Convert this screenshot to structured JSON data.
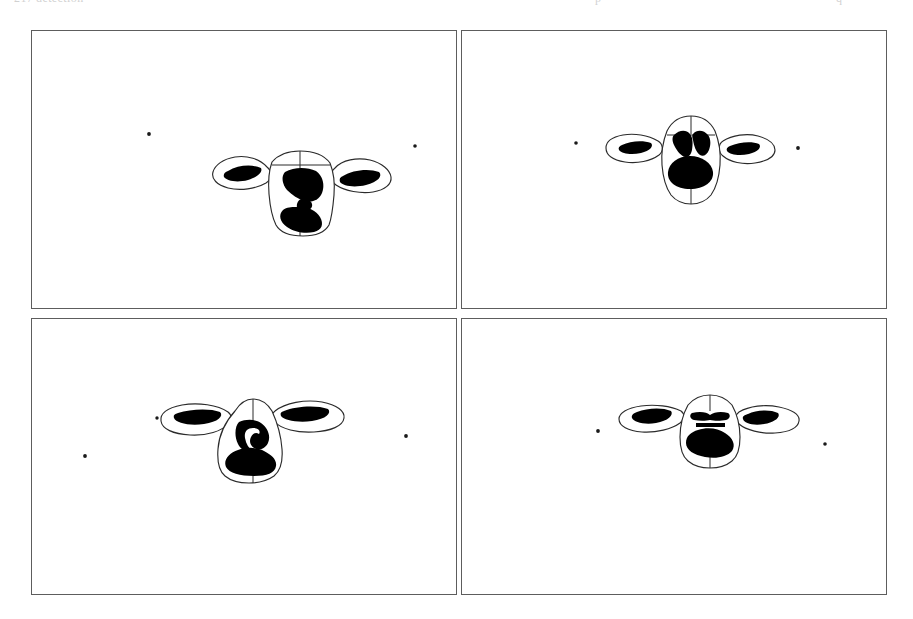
{
  "page": {
    "background_color": "#ffffff",
    "width": 913,
    "height": 619,
    "clipped_header_text": "ions of the head region detected across frames",
    "clipped_header_fragments": [
      {
        "text": "217",
        "left": 14
      },
      {
        "text": "detection",
        "left": 36
      },
      {
        "text": "p",
        "left": 595
      },
      {
        "text": "q",
        "left": 836
      }
    ]
  },
  "figure": {
    "caption": "",
    "panel_count": 4,
    "layout": "2x2 grid",
    "border_color": "#5d5d5d",
    "outline_color": "#2b2b2b",
    "patch_color": "#000000",
    "panels": [
      {
        "id": "panel-a",
        "label": "",
        "position": "top-left",
        "subject": "cow-head-outline",
        "head": {
          "center_x": 285,
          "center_y": 165,
          "width": 132,
          "height": 82,
          "ear_tilt": "slight-down",
          "patches": [
            "forehead-blaze",
            "muzzle-patch",
            "left-ear-patch",
            "right-ear-patch"
          ]
        },
        "specks": [
          {
            "x": 117,
            "y": 103,
            "r": 1.9
          },
          {
            "x": 383,
            "y": 115,
            "r": 1.8
          }
        ]
      },
      {
        "id": "panel-b",
        "label": "",
        "position": "top-right",
        "subject": "cow-head-outline",
        "head": {
          "center_x": 230,
          "center_y": 112,
          "width": 125,
          "height": 78,
          "ear_tilt": "level",
          "patches": [
            "forehead-band",
            "muzzle-oval",
            "left-ear-patch",
            "right-ear-patch"
          ]
        },
        "specks": [
          {
            "x": 114,
            "y": 112,
            "r": 1.8
          },
          {
            "x": 336,
            "y": 117,
            "r": 1.9
          }
        ]
      },
      {
        "id": "panel-c",
        "label": "",
        "position": "bottom-left",
        "subject": "cow-head-outline",
        "head": {
          "center_x": 218,
          "center_y": 117,
          "width": 168,
          "height": 72,
          "ear_tilt": "raised-long",
          "patches": [
            "forehead-blaze",
            "muzzle-band",
            "left-ear-patch",
            "right-ear-patch"
          ]
        },
        "specks": [
          {
            "x": 53,
            "y": 137,
            "r": 1.9
          },
          {
            "x": 125,
            "y": 99,
            "r": 1.7
          },
          {
            "x": 374,
            "y": 117,
            "r": 1.9
          }
        ]
      },
      {
        "id": "panel-d",
        "label": "",
        "position": "bottom-right",
        "subject": "cow-head-outline",
        "head": {
          "center_x": 248,
          "center_y": 111,
          "width": 140,
          "height": 62,
          "ear_tilt": "level-wide",
          "patches": [
            "brow-bar",
            "muzzle-patch",
            "left-ear-patch",
            "right-ear-patch"
          ]
        },
        "specks": [
          {
            "x": 136,
            "y": 112,
            "r": 1.9
          },
          {
            "x": 363,
            "y": 125,
            "r": 1.8
          }
        ]
      }
    ]
  }
}
